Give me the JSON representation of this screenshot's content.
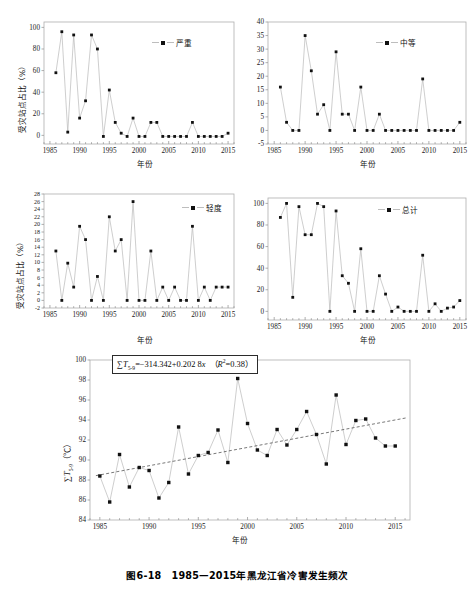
{
  "figure": {
    "caption": "图6-18　1985—2015年黑龙江省冷害发生频次",
    "axis_labels": {
      "x": "年份",
      "y_ratio": "受灾站点占比（%）"
    }
  },
  "chart_data": [
    {
      "type": "line",
      "id": "severe",
      "title": "",
      "legend": "严重",
      "legend_position": "top-right",
      "xlabel": "年份",
      "ylabel": "受灾站点占比（%）",
      "grid": false,
      "xlim": [
        1984,
        2016
      ],
      "ylim": [
        -8,
        105
      ],
      "xticks": [
        1985,
        1990,
        1995,
        2000,
        2005,
        2010,
        2015
      ],
      "yticks": [
        0,
        20,
        40,
        60,
        80,
        100
      ],
      "x": [
        1986,
        1987,
        1988,
        1989,
        1990,
        1991,
        1992,
        1993,
        1994,
        1995,
        1996,
        1997,
        1998,
        1999,
        2000,
        2001,
        2002,
        2003,
        2004,
        2005,
        2006,
        2007,
        2008,
        2009,
        2010,
        2011,
        2012,
        2013,
        2014,
        2015
      ],
      "values": [
        58,
        96,
        3,
        93,
        16,
        32,
        93,
        80,
        -1,
        42,
        12,
        2,
        -1,
        16,
        -1,
        -1,
        12,
        12,
        -1,
        -1,
        -1,
        -1,
        -1,
        12,
        -1,
        -1,
        -1,
        -1,
        -1,
        2
      ]
    },
    {
      "type": "line",
      "id": "moderate",
      "title": "",
      "legend": "中等",
      "legend_position": "top-right",
      "xlabel": "年份",
      "ylabel": "受灾站点占比（%）",
      "grid": false,
      "xlim": [
        1984,
        2016
      ],
      "ylim": [
        -5,
        40
      ],
      "xticks": [
        1985,
        1990,
        1995,
        2000,
        2005,
        2010,
        2015
      ],
      "yticks": [
        -5,
        0,
        5,
        10,
        15,
        20,
        25,
        30,
        35,
        40
      ],
      "x": [
        1986,
        1987,
        1988,
        1989,
        1990,
        1991,
        1992,
        1993,
        1994,
        1995,
        1996,
        1997,
        1998,
        1999,
        2000,
        2001,
        2002,
        2003,
        2004,
        2005,
        2006,
        2007,
        2008,
        2009,
        2010,
        2011,
        2012,
        2013,
        2014,
        2015
      ],
      "values": [
        16,
        3,
        0,
        0,
        35,
        22,
        6,
        9.5,
        0,
        29,
        6,
        6,
        0,
        16,
        0,
        0,
        6,
        0,
        0,
        0,
        0,
        0,
        0,
        19,
        0,
        0,
        0,
        0,
        0,
        3
      ]
    },
    {
      "type": "line",
      "id": "mild",
      "title": "",
      "legend": "轻度",
      "legend_position": "top-right",
      "xlabel": "年份",
      "ylabel": "受灾站点占比（%）",
      "grid": false,
      "xlim": [
        1984,
        2016
      ],
      "ylim": [
        -2,
        28
      ],
      "xticks": [
        1985,
        1990,
        1995,
        2000,
        2005,
        2010,
        2015
      ],
      "yticks": [
        -2,
        0,
        2,
        4,
        6,
        8,
        10,
        12,
        14,
        16,
        18,
        20,
        22,
        24,
        26,
        28
      ],
      "x": [
        1986,
        1987,
        1988,
        1989,
        1990,
        1991,
        1992,
        1993,
        1994,
        1995,
        1996,
        1997,
        1998,
        1999,
        2000,
        2001,
        2002,
        2003,
        2004,
        2005,
        2006,
        2007,
        2008,
        2009,
        2010,
        2011,
        2012,
        2013,
        2014,
        2015
      ],
      "values": [
        13,
        0,
        9.8,
        3.5,
        19.5,
        16,
        0,
        6.3,
        0,
        22,
        13,
        16,
        0,
        26,
        0,
        0,
        13,
        0,
        3.5,
        0,
        3.5,
        0,
        0,
        19.5,
        0,
        3.5,
        0,
        3.5,
        3.5,
        3.5
      ]
    },
    {
      "type": "line",
      "id": "total",
      "title": "",
      "legend": "总计",
      "legend_position": "top-right",
      "xlabel": "年份",
      "ylabel": "受灾站点占比（%）",
      "grid": false,
      "xlim": [
        1984,
        2016
      ],
      "ylim": [
        -8,
        105
      ],
      "xticks": [
        1985,
        1990,
        1995,
        2000,
        2005,
        2010,
        2015
      ],
      "yticks": [
        0,
        20,
        40,
        60,
        80,
        100
      ],
      "x": [
        1986,
        1987,
        1988,
        1989,
        1990,
        1991,
        1992,
        1993,
        1994,
        1995,
        1996,
        1997,
        1998,
        1999,
        2000,
        2001,
        2002,
        2003,
        2004,
        2005,
        2006,
        2007,
        2008,
        2009,
        2010,
        2011,
        2012,
        2013,
        2014,
        2015
      ],
      "values": [
        87,
        100,
        13,
        97,
        71,
        71,
        100,
        97,
        0,
        93,
        33,
        26,
        0,
        58,
        0,
        0,
        33,
        16,
        0,
        4,
        0,
        0,
        0,
        52,
        0,
        7,
        0,
        3,
        4,
        10
      ]
    },
    {
      "type": "scatter",
      "id": "sum-temp",
      "title": "",
      "annotation": "∑T₅₋₉=−314.342+0.202 8x （R²=0.38）",
      "equation": {
        "lhs": "∑T",
        "lhs_sub": "5-9",
        "rhs": "=−314.342+0.202 8",
        "var": "x",
        "r2_label": "R",
        "r2_sup": "2",
        "r2_value": "=0.38"
      },
      "xlabel": "年份",
      "ylabel": "∑T₅₋₉ （℃）",
      "grid": false,
      "trendline": true,
      "xlim": [
        1984,
        2016.5
      ],
      "ylim": [
        84,
        100
      ],
      "xticks": [
        1985,
        1990,
        1995,
        2000,
        2005,
        2010,
        2015
      ],
      "yticks": [
        84,
        86,
        88,
        90,
        92,
        94,
        96,
        98,
        100
      ],
      "x": [
        1985,
        1986,
        1987,
        1988,
        1989,
        1990,
        1991,
        1992,
        1993,
        1994,
        1995,
        1996,
        1997,
        1998,
        1999,
        2000,
        2001,
        2002,
        2003,
        2004,
        2005,
        2006,
        2007,
        2008,
        2009,
        2010,
        2011,
        2012,
        2013,
        2014,
        2015
      ],
      "values": [
        88.4,
        85.8,
        90.55,
        87.3,
        89.25,
        88.95,
        86.2,
        87.75,
        93.3,
        88.6,
        90.45,
        90.75,
        93.0,
        89.75,
        98.15,
        93.65,
        91.0,
        90.45,
        93.05,
        91.5,
        93.05,
        94.85,
        92.55,
        89.6,
        96.5,
        91.55,
        93.95,
        94.1,
        92.2,
        91.4,
        91.4
      ]
    }
  ]
}
